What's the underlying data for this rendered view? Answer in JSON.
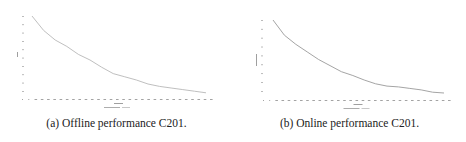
{
  "figure": {
    "panels": [
      {
        "caption": "(a) Offline performance C201.",
        "xlabel": "Generation",
        "ylabel": "Offline",
        "legend": "Number of Migration — (1 stage)"
      },
      {
        "caption": "(b) Online performance C201.",
        "xlabel": "Generation",
        "ylabel": "Online performance",
        "legend": "Number of Migration — (1 stage)"
      }
    ]
  },
  "chart_data": [
    {
      "type": "line",
      "title": "(a) Offline performance C201.",
      "xlabel": "Generation",
      "ylabel": "Offline",
      "note": "Tick labels illegible at this resolution; values normalized to 0-100 of visible axis range.",
      "x_ticks_count": 31,
      "y_ticks_count": 10,
      "grid": false,
      "series": [
        {
          "name": "Offline performance",
          "x": [
            0,
            2,
            4,
            6,
            8,
            10,
            12,
            14,
            16,
            18,
            20,
            22,
            24,
            26,
            28,
            30
          ],
          "values": [
            100,
            82,
            70,
            62,
            52,
            45,
            36,
            28,
            24,
            20,
            15,
            12,
            10,
            8,
            6,
            4
          ]
        }
      ]
    },
    {
      "type": "line",
      "title": "(b) Online performance C201.",
      "xlabel": "Generation",
      "ylabel": "Online performance",
      "note": "Tick labels illegible at this resolution; values normalized to 0-100 of visible axis range.",
      "x_ticks_count": 31,
      "y_ticks_count": 9,
      "grid": false,
      "series": [
        {
          "name": "Online performance",
          "x": [
            0,
            2,
            4,
            6,
            8,
            10,
            12,
            14,
            16,
            18,
            20,
            22,
            24,
            26,
            28,
            30
          ],
          "values": [
            100,
            80,
            68,
            58,
            48,
            40,
            32,
            27,
            21,
            16,
            13,
            12,
            10,
            8,
            5,
            4
          ]
        }
      ]
    }
  ]
}
